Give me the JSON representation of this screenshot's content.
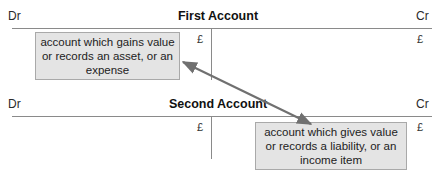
{
  "accounts": [
    {
      "title": "First Account",
      "debit_label": "Dr",
      "credit_label": "Cr",
      "debit_currency": "£",
      "credit_currency": "£",
      "note": {
        "side": "debit",
        "lines": [
          "account which gains value",
          "or records an asset, or an",
          "expense"
        ]
      }
    },
    {
      "title": "Second Account",
      "debit_label": "Dr",
      "credit_label": "Cr",
      "debit_currency": "£",
      "credit_currency": "£",
      "note": {
        "side": "credit",
        "lines": [
          "account which gives value",
          "or records a liability, or an",
          "income item"
        ]
      }
    }
  ],
  "connector": {
    "type": "double-headed-arrow",
    "from": "accounts.0.note",
    "to": "accounts.1.note",
    "color": "#707070"
  },
  "colors": {
    "note_fill": "#e4e4e4",
    "note_border": "#a9a9a9",
    "rule_line": "#8a8a8a"
  }
}
